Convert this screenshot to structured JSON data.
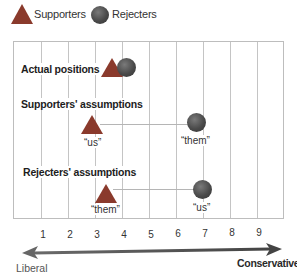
{
  "legend": {
    "supporters": {
      "label": "Supporters",
      "icon": "triangle-icon",
      "color": "#8a3a2c"
    },
    "rejecters": {
      "label": "Rejecters",
      "icon": "circle-icon",
      "color": "#4a4a4a"
    }
  },
  "rows": [
    {
      "label": "Actual positions",
      "supporters_pos": 3.7,
      "rejecters_pos": 4.2
    },
    {
      "label": "Supporters' assumptions",
      "supporters_pos": 3.0,
      "rejecters_pos": 6.8,
      "supporters_tag": "“us”",
      "rejecters_tag": "“them”"
    },
    {
      "label": "Rejecters' assumptions",
      "supporters_pos": 3.3,
      "rejecters_pos": 7.0,
      "supporters_tag": "“them”",
      "rejecters_tag": "“us”"
    }
  ],
  "axis": {
    "ticks": [
      "1",
      "2",
      "3",
      "4",
      "5",
      "6",
      "7",
      "8",
      "9"
    ],
    "left_label": "Liberal",
    "right_label": "Conservative"
  },
  "colors": {
    "triangle": "#8a3a2c",
    "circle": "#4a4a4a",
    "grid": "#c4c4c4",
    "arrow": "#555555"
  }
}
